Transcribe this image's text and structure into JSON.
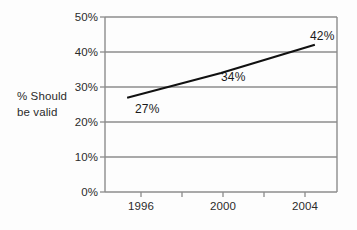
{
  "chart_data": {
    "type": "line",
    "title": "",
    "xlabel": "",
    "ylabel": "% Should be valid",
    "ylabel_lines": [
      "% Should",
      "be valid"
    ],
    "x": [
      1996,
      2000,
      2004
    ],
    "categories": [
      "1996",
      "2000",
      "2004"
    ],
    "values": [
      27,
      34,
      42
    ],
    "point_labels": [
      "27%",
      "34%",
      "42%"
    ],
    "series": [
      {
        "name": "% Should be valid",
        "values": [
          27,
          34,
          42
        ],
        "color": "#111111"
      }
    ],
    "ylim": [
      0,
      50
    ],
    "xlim": [
      1995,
      2005
    ],
    "ytick_values": [
      0,
      10,
      20,
      30,
      40,
      50
    ],
    "ytick_labels": [
      "0%",
      "10%",
      "20%",
      "30%",
      "40%",
      "50%"
    ],
    "xtick_labels": [
      "1996",
      "2000",
      "2004"
    ],
    "grid": true,
    "grid_axis": "y",
    "grid_color": "#8c8c8c",
    "legend": false,
    "legend_position": "none",
    "background_color": "#fdfdfd",
    "axis_color": "#8c8c8c",
    "line_color": "#111111",
    "text_color": "#2b2b2b"
  }
}
